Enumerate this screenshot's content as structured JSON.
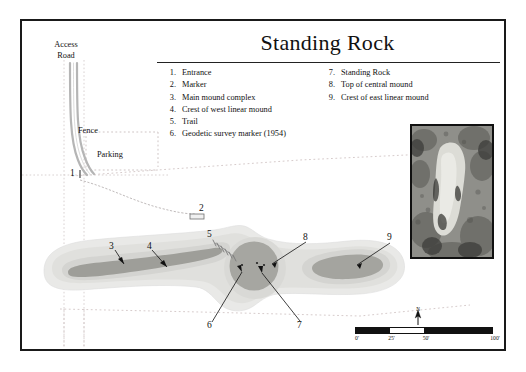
{
  "figure": {
    "title": "Standing Rock",
    "legend": {
      "left_column": [
        {
          "num": "1.",
          "label": "Entrance"
        },
        {
          "num": "2.",
          "label": "Marker"
        },
        {
          "num": "3.",
          "label": "Main mound complex"
        },
        {
          "num": "4.",
          "label": "Crest of west linear mound"
        },
        {
          "num": "5.",
          "label": "Trail"
        },
        {
          "num": "6.",
          "label": "Geodetic survey marker (1954)"
        }
      ],
      "right_column": [
        {
          "num": "7.",
          "label": "Standing Rock"
        },
        {
          "num": "8.",
          "label": "Top of central mound"
        },
        {
          "num": "9.",
          "label": "Crest of east linear mound"
        }
      ]
    },
    "map_labels": {
      "access_road": "Access\nRoad",
      "access_road_line1": "Access",
      "access_road_line2": "Road",
      "fence": "Fence",
      "parking": "Parking"
    },
    "callouts": {
      "c1": "1",
      "c2": "2",
      "c3": "3",
      "c4": "4",
      "c5": "5",
      "c6": "6",
      "c7": "7",
      "c8": "8",
      "c9": "9"
    },
    "scale": {
      "north_label": "N",
      "ticks": [
        "0'",
        "25'",
        "50'",
        "100'"
      ]
    },
    "colors": {
      "ink": "#111111",
      "road": "#b9b9b9",
      "fence": "#c8bdbd",
      "mound_outer": "#e4e4e2",
      "mound_mid": "#d2d2cf",
      "mound_inner": "#b4b4b0",
      "mound_core": "#a0a09c",
      "frame": "#1a1a1a"
    }
  }
}
